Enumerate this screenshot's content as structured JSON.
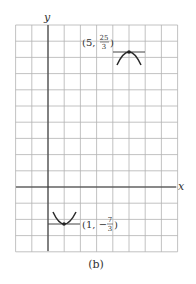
{
  "figure": {
    "caption": "(b)",
    "x_axis_label": "x",
    "y_axis_label": "y",
    "grid": {
      "x_range": [
        -2,
        8
      ],
      "y_range": [
        -4,
        10
      ],
      "cell_px": 16.2
    },
    "points": [
      {
        "name": "max-vertex",
        "x": "5",
        "y_num": "25",
        "y_den": "3",
        "sign": "",
        "type": "maximum"
      },
      {
        "name": "min-vertex",
        "x": "1",
        "y_num": "7",
        "y_den": "3",
        "sign": "−",
        "type": "minimum"
      }
    ],
    "colors": {
      "grid": "#b3b3b3",
      "axis": "#333333",
      "curve": "#2a2a2a"
    }
  },
  "chart_data": {
    "type": "line",
    "title": "",
    "xlabel": "x",
    "ylabel": "y",
    "xlim": [
      -2,
      8
    ],
    "ylim": [
      -4,
      10
    ],
    "grid": true,
    "annotations": [
      {
        "label": "(5, 25/3)",
        "x": 5,
        "y": 8.333,
        "kind": "local maximum, horizontal tangent"
      },
      {
        "label": "(1, -7/3)",
        "x": 1,
        "y": -2.333,
        "kind": "local minimum, horizontal tangent"
      }
    ],
    "caption": "(b)"
  }
}
